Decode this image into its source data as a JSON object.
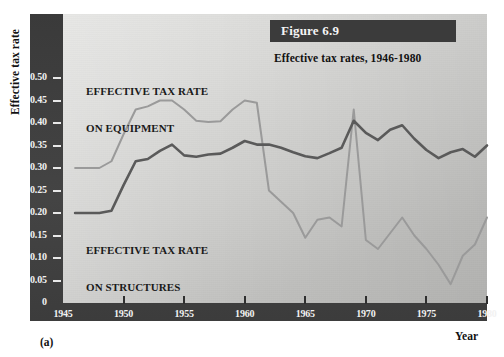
{
  "figure": {
    "banner_label": "Figure 6.9",
    "caption": "Effective tax rates, 1946-1980",
    "panel_letter": "(a)"
  },
  "axes": {
    "y_axis_title": "Effective tax rate",
    "x_axis_title": "Year",
    "y_ticks": [
      "0.50",
      "0.45",
      "0.40",
      "0.35",
      "0.30",
      "0.25",
      "0.20",
      "0.15",
      "0.10",
      "0.05",
      "0"
    ],
    "x_ticks": [
      "1945",
      "1950",
      "1955",
      "1960",
      "1965",
      "1970",
      "1975",
      "1980"
    ]
  },
  "annotations": {
    "equipment_label_line1": "EFFECTIVE TAX RATE",
    "equipment_label_line2": "ON EQUIPMENT",
    "structures_label_line1": "EFFECTIVE TAX RATE",
    "structures_label_line2": "ON STRUCTURES"
  },
  "colors": {
    "frame": "#3e3e3e",
    "banner": "#3b3b3b",
    "plot_background": "#d4d4d2",
    "equipment_line": "#9a9a9a",
    "structures_line": "#5a5a5a",
    "tick_label": "#f2f2f2",
    "text": "#111111"
  },
  "chart_data": {
    "type": "line",
    "title": "Effective tax rates, 1946-1980",
    "xlabel": "Year",
    "ylabel": "Effective tax rate",
    "xlim": [
      1945,
      1980
    ],
    "ylim": [
      0,
      0.5
    ],
    "grid": false,
    "legend": "in-plot annotations",
    "x": [
      1946,
      1947,
      1948,
      1949,
      1950,
      1951,
      1952,
      1953,
      1954,
      1955,
      1956,
      1957,
      1958,
      1959,
      1960,
      1961,
      1962,
      1963,
      1964,
      1965,
      1966,
      1967,
      1968,
      1969,
      1970,
      1971,
      1972,
      1973,
      1974,
      1975,
      1976,
      1977,
      1978,
      1979,
      1980
    ],
    "series": [
      {
        "name": "Effective tax rate on equipment",
        "color": "#9a9a9a",
        "values": [
          0.3,
          0.3,
          0.3,
          0.315,
          0.375,
          0.43,
          0.437,
          0.45,
          0.45,
          0.43,
          0.405,
          0.402,
          0.404,
          0.43,
          0.45,
          0.445,
          0.25,
          0.225,
          0.2,
          0.145,
          0.185,
          0.19,
          0.17,
          0.43,
          0.14,
          0.12,
          0.155,
          0.19,
          0.15,
          0.12,
          0.085,
          0.042,
          0.105,
          0.13,
          0.19
        ]
      },
      {
        "name": "Effective tax rate on structures",
        "color": "#5a5a5a",
        "values": [
          0.2,
          0.2,
          0.2,
          0.205,
          0.262,
          0.315,
          0.32,
          0.338,
          0.352,
          0.328,
          0.325,
          0.33,
          0.332,
          0.345,
          0.36,
          0.352,
          0.352,
          0.345,
          0.335,
          0.326,
          0.322,
          0.333,
          0.345,
          0.405,
          0.378,
          0.362,
          0.385,
          0.395,
          0.365,
          0.34,
          0.322,
          0.335,
          0.342,
          0.325,
          0.35
        ]
      }
    ]
  }
}
